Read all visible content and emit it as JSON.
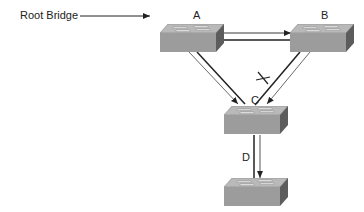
{
  "diagram": {
    "type": "spanning-tree-topology",
    "root_label": "Root Bridge",
    "switches": [
      {
        "id": "A",
        "label": "A",
        "role": "root bridge"
      },
      {
        "id": "B",
        "label": "B"
      },
      {
        "id": "C",
        "label": "C"
      },
      {
        "id": "D",
        "label": ""
      }
    ],
    "link_labels": {
      "c_to_d": "D"
    },
    "links": [
      {
        "from": "A",
        "to": "B",
        "lines": 2,
        "arrow_at": "B"
      },
      {
        "from": "A",
        "to": "C",
        "lines": 2,
        "arrow_at": "C"
      },
      {
        "from": "B",
        "to": "C",
        "lines": 2,
        "arrow_at": "C",
        "blocked": true,
        "blocked_marker": "X"
      },
      {
        "from": "C",
        "to": "D",
        "lines": 2,
        "arrow_at": "D"
      }
    ],
    "colors": {
      "switch_top": "#b8b8b8",
      "switch_front": "#9a9a9a",
      "switch_side": "#5e5e5e",
      "line": "#222222"
    }
  }
}
